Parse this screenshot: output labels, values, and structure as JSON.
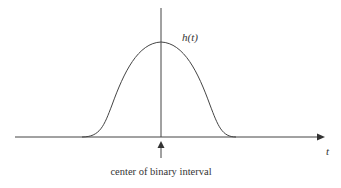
{
  "diagram": {
    "curve_label": "h(t)",
    "axis_label": "t",
    "marker_caption": "center of binary interval",
    "colors": {
      "stroke": "#333333",
      "background": "#ffffff"
    }
  }
}
